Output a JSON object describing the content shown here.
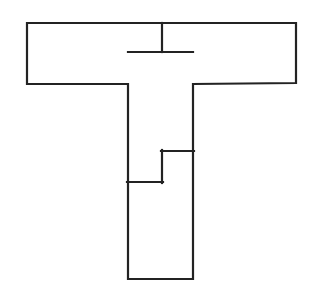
{
  "figure": {
    "title": "T-shaped polygon outline diagram",
    "canvas": {
      "width": 315,
      "height": 297,
      "background_color": "#ffffff"
    },
    "style": {
      "stroke_color": "#232323",
      "stroke_width": 2.2,
      "fill_color": "#ffffff"
    },
    "outline": {
      "name": "t-shape-outline",
      "points": [
        [
          27,
          23
        ],
        [
          296,
          23
        ],
        [
          296,
          83
        ],
        [
          193,
          84
        ],
        [
          193,
          279
        ],
        [
          128,
          279
        ],
        [
          128,
          84
        ],
        [
          27,
          84
        ]
      ],
      "closed": true
    },
    "internal_lines": [
      {
        "name": "top-stem-divider",
        "from": [
          162,
          23
        ],
        "to": [
          162,
          52
        ],
        "orientation": "vertical"
      },
      {
        "name": "stem-top-divider",
        "from": [
          128,
          52
        ],
        "to": [
          193,
          52
        ],
        "orientation": "horizontal"
      },
      {
        "name": "notch-upper-horizontal",
        "from": [
          162,
          151
        ],
        "to": [
          193,
          151
        ],
        "orientation": "horizontal"
      },
      {
        "name": "notch-vertical",
        "from": [
          162,
          151
        ],
        "to": [
          162,
          182
        ],
        "orientation": "vertical"
      },
      {
        "name": "notch-lower-horizontal",
        "from": [
          128,
          182
        ],
        "to": [
          162,
          182
        ],
        "orientation": "horizontal"
      }
    ],
    "regions": [
      {
        "name": "left-arm",
        "label": ""
      },
      {
        "name": "right-arm",
        "label": ""
      },
      {
        "name": "stem-upper",
        "label": ""
      },
      {
        "name": "stem-lower",
        "label": ""
      }
    ]
  }
}
